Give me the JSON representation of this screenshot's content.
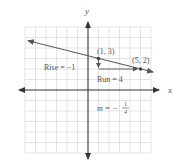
{
  "diagram": {
    "x_axis_label": "x",
    "y_axis_label": "y",
    "grid": {
      "xmin": -6,
      "xmax": 6,
      "ymin": -6,
      "ymax": 6,
      "step": 1
    },
    "points": [
      {
        "label": "(1, 3)",
        "x": 1,
        "y": 3
      },
      {
        "label": "(5, 2)",
        "x": 5,
        "y": 2
      }
    ],
    "rise_label": "Rise = −1",
    "run_label": "Run = 4",
    "slope_label_prefix": "m = −",
    "slope_numerator": "1",
    "slope_denominator": "4",
    "colors": {
      "grid": "#d8d8d8",
      "axis": "#333333",
      "line": "#555555",
      "text": "#555555"
    }
  }
}
